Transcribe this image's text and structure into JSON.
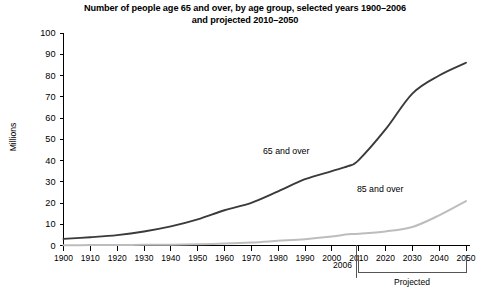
{
  "chart_data": {
    "type": "line",
    "title": "Number of people age 65 and over, by age group, selected years 1900–2006 and projected 2010–2050",
    "title_line1": "Number of people age 65 and over, by age group, selected years 1900–2006",
    "title_line2": "and projected 2010–2050",
    "xlabel": "",
    "ylabel": "Millions",
    "xlim": [
      1900,
      2050
    ],
    "ylim": [
      0,
      100
    ],
    "grid": false,
    "legend_position": "inline-annotation",
    "x": [
      1900,
      1910,
      1920,
      1930,
      1940,
      1950,
      1960,
      1970,
      1980,
      1990,
      2000,
      2006,
      2010,
      2020,
      2030,
      2040,
      2050
    ],
    "xticks": [
      "1900",
      "1910",
      "1920",
      "1930",
      "1940",
      "1950",
      "1960",
      "1970",
      "1980",
      "1990",
      "2000",
      "2010",
      "2020",
      "2030",
      "2040",
      "2050"
    ],
    "yticks": [
      "0",
      "10",
      "20",
      "30",
      "40",
      "50",
      "60",
      "70",
      "80",
      "90",
      "100"
    ],
    "series": [
      {
        "name": "65 and over",
        "color": "#3a3a3a",
        "values": [
          3.1,
          3.9,
          4.9,
          6.6,
          9.0,
          12.3,
          16.6,
          20.1,
          25.5,
          31.2,
          35.0,
          37.3,
          40.2,
          54.6,
          71.5,
          80.0,
          86.0
        ]
      },
      {
        "name": "85 and over",
        "color": "#bdbdbd",
        "values": [
          0.1,
          0.2,
          0.2,
          0.3,
          0.4,
          0.6,
          0.9,
          1.4,
          2.2,
          3.0,
          4.2,
          5.3,
          5.5,
          6.6,
          8.7,
          14.2,
          20.9
        ]
      }
    ],
    "annotations": [
      {
        "text": "65 and over",
        "x": 1983,
        "y": 43
      },
      {
        "text": "85 and over",
        "x": 2018,
        "y": 25
      },
      {
        "text": "2006",
        "x": 2006,
        "y": -14
      },
      {
        "text": "Projected",
        "x": 2032,
        "y": -22
      }
    ],
    "projection_start_year": 2010,
    "divider_year": 2008
  }
}
